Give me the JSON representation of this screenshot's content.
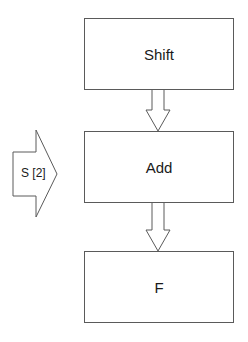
{
  "diagram": {
    "nodes": [
      {
        "id": "shift",
        "label": "Shift"
      },
      {
        "id": "add",
        "label": "Add"
      },
      {
        "id": "f",
        "label": "F"
      }
    ],
    "edges": [
      {
        "from": "shift",
        "to": "add"
      },
      {
        "from": "add",
        "to": "f"
      }
    ],
    "input_arrow": {
      "label": "S [2]",
      "target": "add"
    },
    "colors": {
      "stroke": "#5a5a5a",
      "fill": "#ffffff",
      "text": "#1a1a1a"
    }
  }
}
